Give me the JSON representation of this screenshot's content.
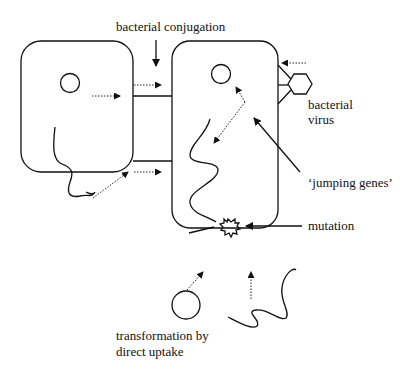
{
  "labels": {
    "conjugation": "bacterial conjugation",
    "virus_line1": "bacterial",
    "virus_line2": "virus",
    "jumping_genes": "‘jumping genes’",
    "mutation": "mutation",
    "transformation_line1": "transformation by",
    "transformation_line2": "direct uptake"
  },
  "cells": [
    {
      "name": "donor-cell",
      "contents": [
        "plasmid",
        "chromosome"
      ]
    },
    {
      "name": "recipient-cell",
      "contents": [
        "plasmid",
        "chromosome",
        "mutation-site"
      ]
    }
  ],
  "colors": {
    "line": "#111111",
    "background": "#ffffff"
  }
}
